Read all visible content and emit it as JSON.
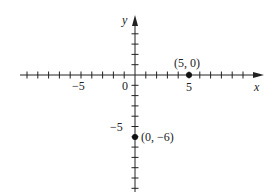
{
  "chart_data": {
    "type": "scatter",
    "title": "",
    "xlabel": "x",
    "ylabel": "y",
    "xlim": [
      -10,
      11
    ],
    "ylim": [
      -11,
      5
    ],
    "grid": false,
    "x_tick_labels": [
      {
        "value": -5,
        "label": "−5"
      },
      {
        "value": 0,
        "label": "0"
      },
      {
        "value": 5,
        "label": "5"
      }
    ],
    "y_tick_labels": [
      {
        "value": -5,
        "label": "−5"
      }
    ],
    "points": [
      {
        "x": 5,
        "y": 0,
        "label": "(5, 0)"
      },
      {
        "x": 0,
        "y": -6,
        "label": "(0, −6)"
      }
    ]
  },
  "labels": {
    "x_axis": "x",
    "y_axis": "y",
    "origin": "0",
    "x_neg5": "−5",
    "x_pos5": "5",
    "y_neg5": "−5",
    "point_a": "(5, 0)",
    "point_b": "(0, −6)"
  },
  "colors": {
    "axis": "#222222",
    "point": "#111111",
    "background": "#ffffff"
  }
}
